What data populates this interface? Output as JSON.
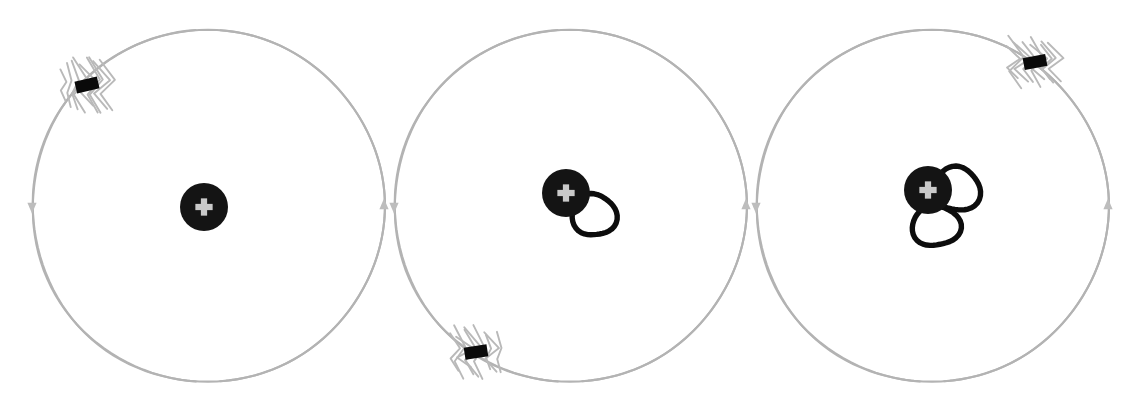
{
  "figure": {
    "description": "Three hand-drawn atom diagrams in a row. Each shows a positively charged nucleus at the centre of a large grey circular electron orbit, with a single negatively charged electron drawn as a short black bar surrounded by sketchy vibration strokes. Moving left to right the atom has emitted zero, one and then two photons, drawn as heavy black outlined circles overlapping the nucleus.",
    "canvas": {
      "width": 1140,
      "height": 412
    },
    "background_color": "#ffffff"
  },
  "palette": {
    "orbit_stroke": "#b3b3b3",
    "orbit_arrow": "#bdbdbd",
    "nucleus_fill": "#141414",
    "nucleus_sign_fill": "#c9c9c9",
    "photon_ring_stroke": "#0d0d0d",
    "electron_fill": "#0a0a0a",
    "jitter_stroke": "#b9b9b9"
  },
  "glyphs": {
    "nucleus_charge_symbol": "+",
    "electron_charge_symbol": "−",
    "orbit_direction_symbol": "↓"
  },
  "labels": {
    "nucleus": "nucleus",
    "electron": "electron",
    "orbit": "electron orbit",
    "photon": "emitted photon",
    "vibration": "vibration strokes"
  },
  "atoms": [
    {
      "index": 1,
      "name": "atom-unexcited",
      "caption": "Atom with electron in orbit, no photons emitted",
      "orbit": {
        "center_x": 208,
        "center_y": 206,
        "radius_x": 176,
        "radius_y": 176,
        "arrow_left": {
          "x": 32,
          "y": 206,
          "direction": "down"
        },
        "arrow_right": {
          "x": 384,
          "y": 206,
          "direction": "up"
        }
      },
      "nucleus": {
        "center_x": 204,
        "center_y": 207,
        "radius": 24,
        "charge": "+"
      },
      "electron": {
        "center_x": 87,
        "center_y": 85,
        "width": 23,
        "height": 12,
        "angle_deg": -13,
        "orbit_angle_deg": 221,
        "charge": "−"
      },
      "photon_count": 0,
      "photons": []
    },
    {
      "index": 2,
      "name": "atom-one-photon",
      "caption": "Atom after emitting one photon; electron has moved around the orbit",
      "orbit": {
        "center_x": 570,
        "center_y": 206,
        "radius_x": 176,
        "radius_y": 176,
        "arrow_left": {
          "x": 394,
          "y": 206,
          "direction": "down"
        },
        "arrow_right": {
          "x": 746,
          "y": 206,
          "direction": "up"
        }
      },
      "nucleus": {
        "center_x": 566,
        "center_y": 193,
        "radius": 24,
        "charge": "+"
      },
      "electron": {
        "center_x": 476,
        "center_y": 352,
        "width": 23,
        "height": 12,
        "angle_deg": -9,
        "orbit_angle_deg": 123,
        "charge": "−"
      },
      "photon_count": 1,
      "photons": [
        {
          "center_x": 594,
          "center_y": 215,
          "radius_x": 21,
          "radius_y": 22,
          "rotation_deg": -8
        }
      ]
    },
    {
      "index": 3,
      "name": "atom-two-photons",
      "caption": "Atom after emitting two photons; electron has moved further around the orbit",
      "orbit": {
        "center_x": 932,
        "center_y": 206,
        "radius_x": 176,
        "radius_y": 176,
        "arrow_left": {
          "x": 756,
          "y": 206,
          "direction": "down"
        },
        "arrow_right": {
          "x": 1108,
          "y": 206,
          "direction": "up"
        }
      },
      "nucleus": {
        "center_x": 928,
        "center_y": 190,
        "radius": 24,
        "charge": "+"
      },
      "electron": {
        "center_x": 1035,
        "center_y": 62,
        "width": 23,
        "height": 12,
        "angle_deg": -11,
        "orbit_angle_deg": 321,
        "charge": "−"
      },
      "photon_count": 2,
      "photons": [
        {
          "center_x": 957,
          "center_y": 189,
          "radius_x": 22,
          "radius_y": 23,
          "rotation_deg": 6
        },
        {
          "center_x": 936,
          "center_y": 226,
          "radius_x": 23,
          "radius_y": 21,
          "rotation_deg": -12
        }
      ]
    }
  ],
  "sequence": {
    "photon_counts": [
      0,
      1,
      2
    ],
    "order": "left-to-right"
  }
}
